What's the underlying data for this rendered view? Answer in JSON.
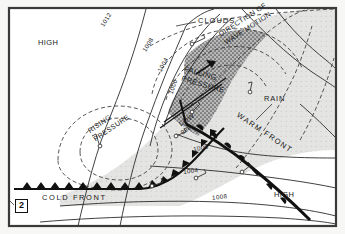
{
  "figure": {
    "panel_number": "2",
    "type": "synoptic-weather-map",
    "frame_color": "#3a3a3a",
    "background_color": "#f7f7f5"
  },
  "pressure_systems": [
    {
      "id": "high-nw",
      "label": "HIGH",
      "x": 52,
      "y": 44
    },
    {
      "id": "high-se",
      "label": "HIGH",
      "x": 288,
      "y": 196
    },
    {
      "id": "low",
      "label": "LOW",
      "x": 186,
      "y": 122
    }
  ],
  "low_center_value": "996",
  "isobars": [
    {
      "value": "1012",
      "x": 101,
      "y": 19,
      "rot": -58
    },
    {
      "value": "1008",
      "x": 143,
      "y": 44,
      "rot": -58
    },
    {
      "value": "1004",
      "x": 158,
      "y": 64,
      "rot": -62
    },
    {
      "value": "1000",
      "x": 168,
      "y": 86,
      "rot": -70
    },
    {
      "value": "1000",
      "x": 196,
      "y": 147,
      "rot": -12
    },
    {
      "value": "1004",
      "x": 186,
      "y": 170,
      "rot": -8
    },
    {
      "value": "1008",
      "x": 215,
      "y": 196,
      "rot": -7
    }
  ],
  "fronts": [
    {
      "id": "cold-front",
      "label": "COLD FRONT",
      "x": 60,
      "y": 196,
      "rot": 0,
      "symbol": "triangles"
    },
    {
      "id": "warm-front",
      "label": "WARM FRONT",
      "x": 246,
      "y": 136,
      "rot": 34,
      "symbol": "semicircles"
    }
  ],
  "annotations": [
    {
      "id": "clouds",
      "label": "CLOUDS",
      "x": 200,
      "y": 20,
      "rot": 0
    },
    {
      "id": "rain",
      "label": "RAIN",
      "x": 273,
      "y": 98,
      "rot": 0
    },
    {
      "id": "falling-pressure",
      "label": "FALLING\nPRESSURE",
      "line1": "FALLING",
      "line2": "PRESSURE",
      "x": 196,
      "y": 76,
      "rot": 16
    },
    {
      "id": "rising-pressure",
      "label": "RISING\nPRESSURE",
      "line1": "RISING",
      "line2": "PRESSURE",
      "x": 100,
      "y": 122,
      "rot": -34
    },
    {
      "id": "direction-of-wave-motion",
      "label": "DIRECTION OF\nWAVE MOTION",
      "line1": "DIRECTION OF",
      "line2": "WAVE MOTION",
      "x": 243,
      "y": 25,
      "rot": -33
    }
  ],
  "legend_note": {
    "rain_shading": "dark stipple",
    "cloud_shading": "light grey"
  }
}
